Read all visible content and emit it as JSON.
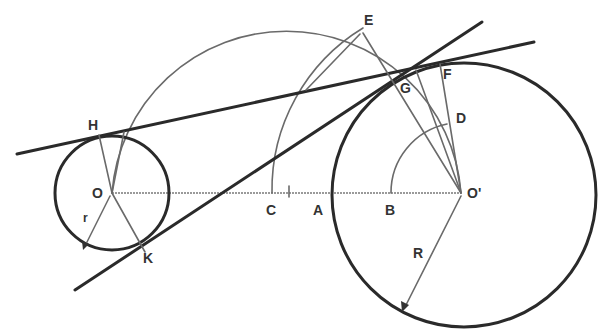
{
  "diagram": {
    "colors": {
      "ink": "#2a2a2a",
      "construction": "#6a6a6a",
      "background": "#ffffff"
    },
    "labels": {
      "E": "E",
      "F": "F",
      "G": "G",
      "D": "D",
      "H": "H",
      "O": "O",
      "O_prime": "O'",
      "C": "C",
      "A": "A",
      "B": "B",
      "K": "K",
      "r": "r",
      "R": "R"
    },
    "elements": {
      "small_circle": {
        "center": "O",
        "radius_label": "r"
      },
      "large_circle": {
        "center": "O'",
        "radius_label": "R"
      },
      "tangent_lines": [
        "upper tangent through H and G",
        "lower tangent through K and G"
      ],
      "construction_arcs": [
        "semicircle on OO'",
        "arc C–E centered O'",
        "arc B–D centered O'"
      ]
    }
  }
}
